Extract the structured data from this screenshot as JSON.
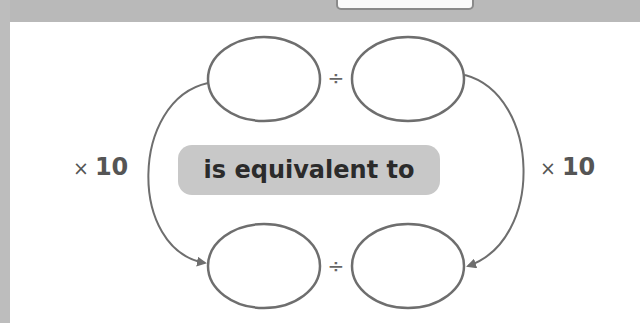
{
  "diagram": {
    "center_label": "is equivalent to",
    "left_operation": {
      "symbol": "×",
      "value": "10"
    },
    "right_operation": {
      "symbol": "×",
      "value": "10"
    },
    "top_row": {
      "left_blank": "",
      "operator": "÷",
      "right_blank": ""
    },
    "bottom_row": {
      "left_blank": "",
      "operator": "÷",
      "right_blank": ""
    }
  },
  "colors": {
    "background": "#ffffff",
    "frame_gray": "#b9b9b9",
    "pill_fill": "#c8c8c8",
    "stroke": "#707070",
    "text": "#2b2b2b"
  }
}
